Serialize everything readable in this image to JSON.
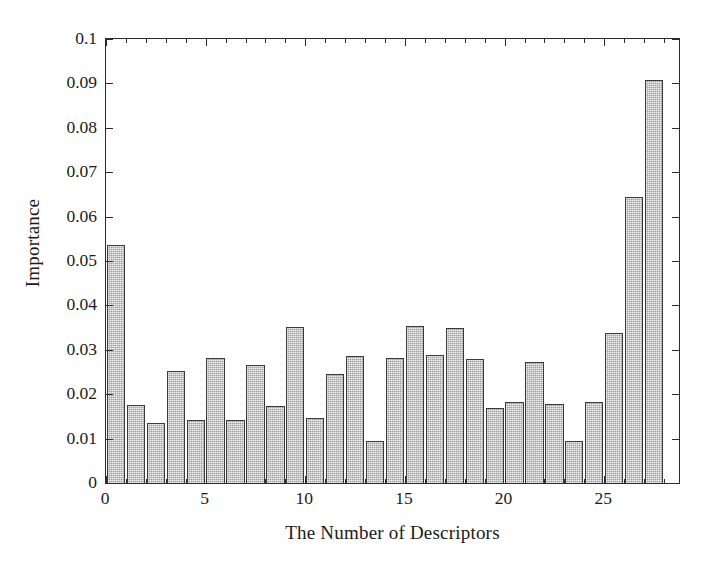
{
  "figure": {
    "background_color": "#ffffff",
    "frame_color": "#2b2b2b",
    "bar_fill_color": "#9e9e9e",
    "bar_edge_color": "#3a3a3a"
  },
  "axes": {
    "ylabel": "Importance",
    "xlabel": "The Number of Descriptors",
    "ytick_labels": [
      "0",
      "0.01",
      "0.02",
      "0.03",
      "0.04",
      "0.05",
      "0.06",
      "0.07",
      "0.08",
      "0.09",
      "0.1"
    ],
    "xtick_labels": [
      "0",
      "5",
      "10",
      "15",
      "20",
      "25"
    ]
  },
  "chart_data": {
    "type": "bar",
    "title": "",
    "xlabel": "The Number of Descriptors",
    "ylabel": "Importance",
    "xlim": [
      0,
      28.75
    ],
    "ylim": [
      0,
      0.1
    ],
    "grid": false,
    "legend": null,
    "ytick_values": [
      0,
      0.01,
      0.02,
      0.03,
      0.04,
      0.05,
      0.06,
      0.07,
      0.08,
      0.09,
      0.1
    ],
    "xtick_values": [
      0,
      5,
      10,
      15,
      20,
      25
    ],
    "categories": [
      1,
      2,
      3,
      4,
      5,
      6,
      7,
      8,
      9,
      10,
      11,
      12,
      13,
      14,
      15,
      16,
      17,
      18,
      19,
      20,
      21,
      22,
      23,
      24,
      25,
      26,
      27,
      28
    ],
    "values": [
      0.0535,
      0.0176,
      0.0135,
      0.0252,
      0.0143,
      0.0281,
      0.0141,
      0.0265,
      0.0174,
      0.0352,
      0.0146,
      0.0245,
      0.0285,
      0.0094,
      0.0281,
      0.0353,
      0.0288,
      0.035,
      0.028,
      0.0169,
      0.0183,
      0.0272,
      0.0178,
      0.0095,
      0.0183,
      0.0338,
      0.0645,
      0.0908
    ]
  }
}
